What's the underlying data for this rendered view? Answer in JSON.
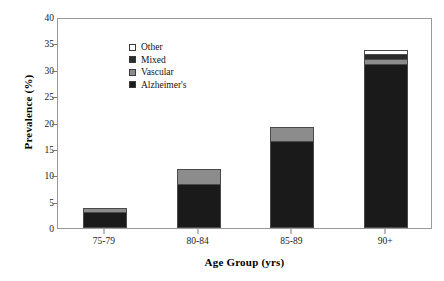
{
  "chart_data": {
    "type": "bar",
    "stacked": true,
    "title": "",
    "xlabel": "Age Group (yrs)",
    "ylabel": "Prevalence (%)",
    "categories": [
      "75-79",
      "80-84",
      "85-89",
      "90+"
    ],
    "ylim": [
      0,
      40
    ],
    "yticks": [
      0,
      5,
      10,
      15,
      20,
      25,
      30,
      35,
      40
    ],
    "grid": false,
    "legend_position": "top-left",
    "series": [
      {
        "name": "Alzheimer's",
        "color": "#1a1a1a",
        "values": [
          3.0,
          8.3,
          16.5,
          31.0
        ]
      },
      {
        "name": "Vascular",
        "color": "#8c8c8c",
        "values": [
          1.0,
          3.1,
          2.8,
          1.3
        ]
      },
      {
        "name": "Mixed",
        "color": "#2b2b2b",
        "values": [
          0.0,
          0.0,
          0.0,
          1.1
        ]
      },
      {
        "name": "Other",
        "color": "#ffffff",
        "values": [
          0.0,
          0.0,
          0.0,
          0.9
        ]
      }
    ],
    "totals": [
      4.0,
      11.4,
      19.3,
      34.3
    ],
    "stack_order_bottom_to_top": [
      "Alzheimer's",
      "Vascular",
      "Mixed",
      "Other"
    ],
    "legend_order_top_to_bottom": [
      "Other",
      "Mixed",
      "Vascular",
      "Alzheimer's"
    ]
  },
  "axes": {
    "y_tick_labels": [
      "40",
      "35",
      "30",
      "25",
      "20",
      "15",
      "10",
      "5",
      "0"
    ],
    "x_tick_labels": [
      "75-79",
      "80-84",
      "85-89",
      "90+"
    ],
    "y_axis_title": "Prevalence (%)",
    "x_axis_title": "Age Group (yrs)"
  },
  "legend": {
    "items": [
      {
        "label": "Other",
        "color": "#ffffff"
      },
      {
        "label": "Mixed",
        "color": "#2b2b2b"
      },
      {
        "label": "Vascular",
        "color": "#8c8c8c"
      },
      {
        "label": "Alzheimer's",
        "color": "#1a1a1a"
      }
    ]
  },
  "colors": {
    "frame": "#9a9a9a",
    "bar_outline": "#4a4a4a",
    "text": "#111111",
    "background": "#ffffff"
  }
}
